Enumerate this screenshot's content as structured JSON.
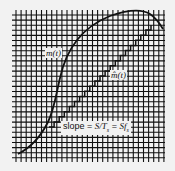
{
  "figure": {
    "type": "delta-modulation-diagram",
    "grid": {
      "x0": 12,
      "y0": 10,
      "x1": 165,
      "y1": 162,
      "spacing": 5.1,
      "color": "#111111"
    },
    "curves": {
      "signal": {
        "label": "m(t)",
        "color": "#111111"
      },
      "staircase": {
        "label": "m̂(t)",
        "color": "#111111"
      }
    },
    "annotation": {
      "prefix": "slope = ",
      "term1": "S/T",
      "term1_sub": "s",
      "eq": " = ",
      "term2": "Sf",
      "term2_sub": "s"
    }
  }
}
